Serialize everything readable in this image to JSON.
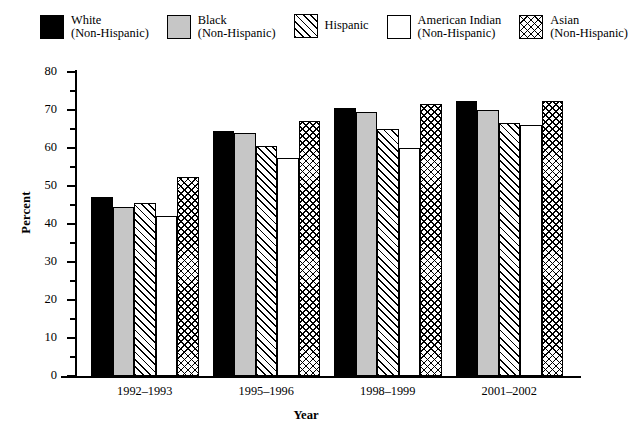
{
  "chart_data": {
    "type": "bar",
    "title": "",
    "xlabel": "Year",
    "ylabel": "Percent",
    "ylim": [
      0,
      80
    ],
    "ytick_step": 10,
    "yminor_step": 5,
    "grid": false,
    "legend_position": "top",
    "categories": [
      "1992–1993",
      "1995–1996",
      "1998–1999",
      "2001–2002"
    ],
    "series": [
      {
        "name": "White (Non-Hispanic)",
        "fill": "solid-black",
        "values": [
          47.0,
          64.5,
          70.5,
          72.5
        ]
      },
      {
        "name": "Black (Non-Hispanic)",
        "fill": "solid-gray",
        "values": [
          44.5,
          64.0,
          69.5,
          70.0
        ]
      },
      {
        "name": "Hispanic",
        "fill": "diagonal",
        "values": [
          45.5,
          60.5,
          65.0,
          66.5
        ]
      },
      {
        "name": "American Indian (Non-Hispanic)",
        "fill": "white",
        "values": [
          42.0,
          57.5,
          60.0,
          66.0
        ]
      },
      {
        "name": "Asian (Non-Hispanic)",
        "fill": "crosshatch",
        "values": [
          52.5,
          67.0,
          71.5,
          72.5
        ]
      }
    ],
    "ytick_labels": [
      "0",
      "10",
      "20",
      "30",
      "40",
      "50",
      "60",
      "70",
      "80"
    ]
  },
  "legend": {
    "items": [
      {
        "line1": "White",
        "line2": "(Non-Hispanic)",
        "swatch": "solid-black"
      },
      {
        "line1": "Black",
        "line2": "(Non-Hispanic)",
        "swatch": "solid-gray"
      },
      {
        "line1": "Hispanic",
        "line2": "",
        "swatch": "diagonal"
      },
      {
        "line1": "American Indian",
        "line2": "(Non-Hispanic)",
        "swatch": "white"
      },
      {
        "line1": "Asian",
        "line2": "(Non-Hispanic)",
        "swatch": "crosshatch"
      }
    ]
  },
  "axes": {
    "y_title": "Percent",
    "x_title": "Year"
  },
  "colors": {
    "ink": "#000000",
    "gray_fill": "#c6c6c6",
    "background": "#ffffff"
  }
}
